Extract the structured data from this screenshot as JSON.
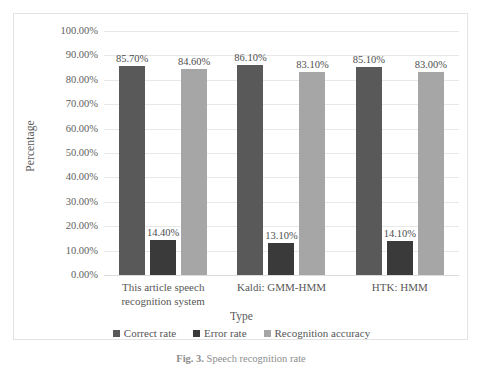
{
  "chart_data": {
    "type": "bar",
    "title": "",
    "xlabel": "Type",
    "ylabel": "Percentage",
    "ylim": [
      0,
      1.0
    ],
    "grid": true,
    "legend_position": "bottom",
    "categories": [
      "This article speech recognition system",
      "Kaldi: GMM-HMM",
      "HTK: HMM"
    ],
    "series": [
      {
        "name": "Correct rate",
        "color": "#595959",
        "values": [
          0.857,
          0.861,
          0.851
        ],
        "labels": [
          "85.70%",
          "86.10%",
          "85.10%"
        ]
      },
      {
        "name": "Error rate",
        "color": "#3a3a3a",
        "values": [
          0.144,
          0.131,
          0.141
        ],
        "labels": [
          "14.40%",
          "13.10%",
          "14.10%"
        ]
      },
      {
        "name": "Recognition accuracy",
        "color": "#a6a6a6",
        "values": [
          0.846,
          0.831,
          0.83
        ],
        "labels": [
          "84.60%",
          "83.10%",
          "83.00%"
        ]
      }
    ],
    "yticks": [
      "0.00%",
      "10.00%",
      "20.00%",
      "30.00%",
      "40.00%",
      "50.00%",
      "60.00%",
      "70.00%",
      "80.00%",
      "90.00%",
      "100.00%"
    ],
    "ytick_values": [
      0,
      0.1,
      0.2,
      0.3,
      0.4,
      0.5,
      0.6,
      0.7,
      0.8,
      0.9,
      1.0
    ]
  },
  "axis": {
    "y_title": "Percentage",
    "x_title": "Type"
  },
  "x_labels": [
    "This article speech recognition system",
    "Kaldi: GMM-HMM",
    "HTK: HMM"
  ],
  "legend": {
    "items": [
      {
        "label": "Correct rate",
        "color": "#595959"
      },
      {
        "label": "Error rate",
        "color": "#3a3a3a"
      },
      {
        "label": "Recognition accuracy",
        "color": "#a6a6a6"
      }
    ]
  },
  "caption": {
    "prefix": "Fig. 3.",
    "rest": " Speech recognition rate"
  }
}
